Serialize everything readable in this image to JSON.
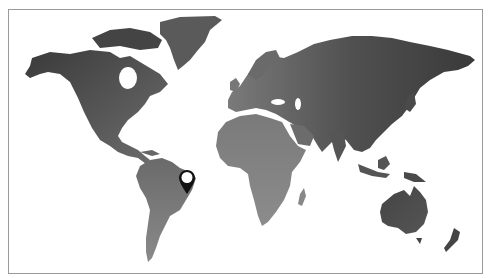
{
  "map": {
    "type": "world-map",
    "style": "grayscale-gradient",
    "colors": {
      "land_dark": "#3e3e3e",
      "land_mid": "#6a6a6a",
      "land_light": "#8c8c8c",
      "ocean": "#ffffff",
      "frame_border": "#9a9a9a"
    },
    "continents": [
      "North America",
      "Greenland",
      "South America",
      "Europe",
      "Africa",
      "Asia",
      "Australia",
      "New Zealand"
    ],
    "markers": [
      {
        "name": "location-pin",
        "region": "Brazil (northeast coast)",
        "x": 186,
        "y": 180,
        "icon": "map-pin-icon"
      }
    ]
  }
}
